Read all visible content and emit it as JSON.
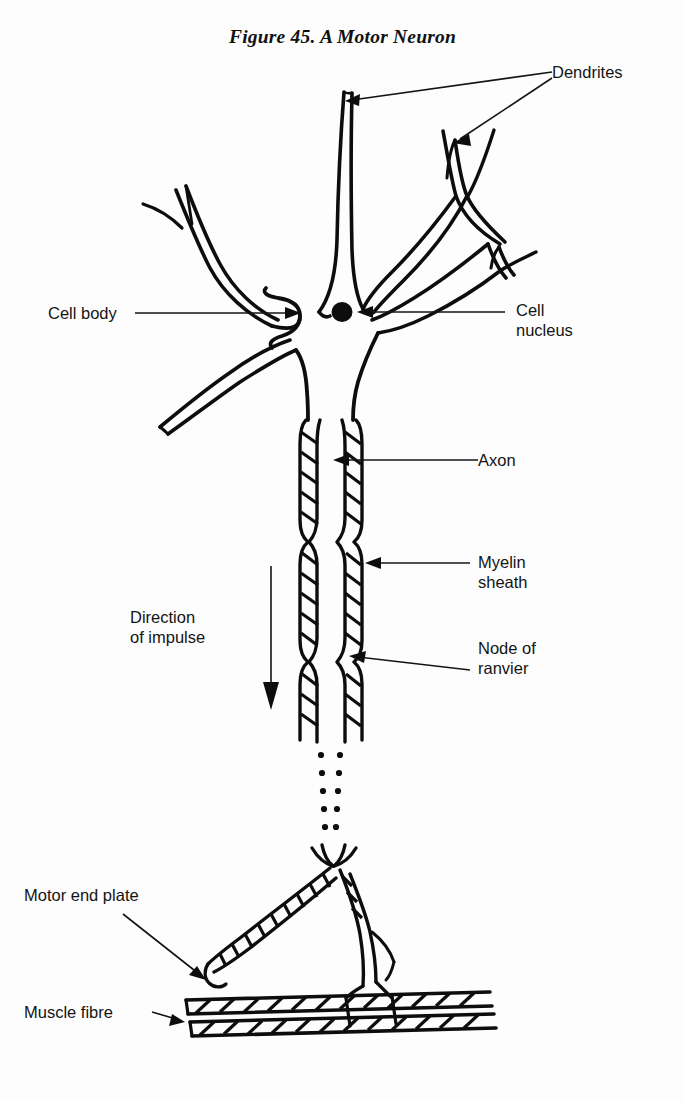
{
  "figure": {
    "title": "Figure 45. A Motor Neuron",
    "background_color": "#fdfdfd",
    "ink_color": "#0d0d0d"
  },
  "labels": {
    "dendrites": "Dendrites",
    "cell_body": "Cell body",
    "cell_nucleus_line1": "Cell",
    "cell_nucleus_line2": "nucleus",
    "axon": "Axon",
    "myelin_line1": "Myelin",
    "myelin_line2": "sheath",
    "node_line1": "Node of",
    "node_line2": "ranvier",
    "direction_line1": "Direction",
    "direction_line2": "of impulse",
    "motor_end_plate": "Motor end plate",
    "muscle_fibre": "Muscle fibre"
  },
  "diagram_parts": [
    "dendrites",
    "cell-body",
    "cell-nucleus",
    "axon",
    "myelin-sheath",
    "node-of-ranvier",
    "axon-terminal-branches",
    "motor-end-plate",
    "muscle-fibre",
    "impulse-direction-arrow"
  ]
}
